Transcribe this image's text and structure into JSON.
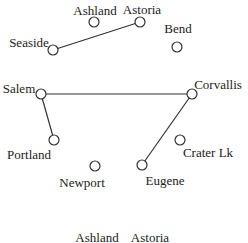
{
  "graph": {
    "nodes": [
      {
        "id": "ashland",
        "label": "Ashland",
        "x": 94,
        "y": 22,
        "lx": 95,
        "ly": 10
      },
      {
        "id": "astoria",
        "label": "Astoria",
        "x": 140,
        "y": 22,
        "lx": 142,
        "ly": 9
      },
      {
        "id": "bend",
        "label": "Bend",
        "x": 177,
        "y": 47,
        "lx": 178,
        "ly": 28
      },
      {
        "id": "seaside",
        "label": "Seaside",
        "x": 53,
        "y": 50,
        "lx": 29,
        "ly": 42
      },
      {
        "id": "salem",
        "label": "Salem",
        "x": 41,
        "y": 94,
        "lx": 19,
        "ly": 88
      },
      {
        "id": "corvallis",
        "label": "Corvallis",
        "x": 192,
        "y": 94,
        "lx": 218,
        "ly": 84
      },
      {
        "id": "portland",
        "label": "Portland",
        "x": 54,
        "y": 140,
        "lx": 29,
        "ly": 154
      },
      {
        "id": "newport",
        "label": "Newport",
        "x": 95,
        "y": 166,
        "lx": 82,
        "ly": 182
      },
      {
        "id": "craterlk",
        "label": "Crater Lk",
        "x": 180,
        "y": 140,
        "lx": 208,
        "ly": 152
      },
      {
        "id": "eugene",
        "label": "Eugene",
        "x": 142,
        "y": 165,
        "lx": 165,
        "ly": 180
      }
    ],
    "edges": [
      {
        "from": "seaside",
        "to": "astoria"
      },
      {
        "from": "salem",
        "to": "corvallis"
      },
      {
        "from": "salem",
        "to": "portland"
      },
      {
        "from": "corvallis",
        "to": "eugene"
      }
    ]
  },
  "bottom_labels": [
    {
      "label": "Ashland",
      "x": 97,
      "y": 237
    },
    {
      "label": "Astoria",
      "x": 150,
      "y": 237
    }
  ],
  "colors": {
    "stroke": "#333333",
    "text": "#222222",
    "node_fill": "#ffffff"
  }
}
